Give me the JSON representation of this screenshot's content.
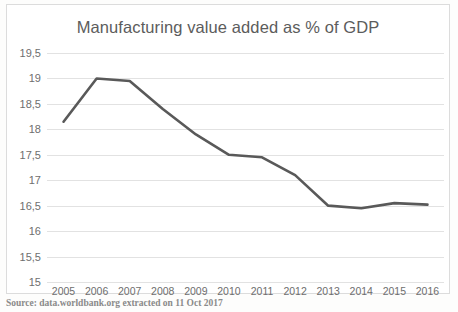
{
  "chart_data": {
    "type": "line",
    "title": "Manufacturing value added as % of GDP",
    "xlabel": "",
    "ylabel": "",
    "categories": [
      "2005",
      "2006",
      "2007",
      "2008",
      "2009",
      "2010",
      "2011",
      "2012",
      "2013",
      "2014",
      "2015",
      "2016"
    ],
    "values": [
      18.15,
      19.0,
      18.95,
      18.4,
      17.9,
      17.5,
      17.45,
      17.1,
      16.5,
      16.45,
      16.55,
      16.52
    ],
    "ylim": [
      15,
      19.5
    ],
    "ytick_labels": [
      "19,5",
      "19",
      "18,5",
      "18",
      "17,5",
      "17",
      "16,5",
      "16",
      "15,5",
      "15"
    ],
    "ytick_values": [
      19.5,
      19,
      18.5,
      18,
      17.5,
      17,
      16.5,
      16,
      15.5,
      15
    ],
    "grid": true,
    "legend": "none",
    "line_color": "#595959",
    "grid_color": "#e2e2e2"
  },
  "source_note": "Source: data.worldbank.org extracted on 11 Oct 2017",
  "watermarks": {
    "one": "",
    "two": "",
    "three": ""
  }
}
